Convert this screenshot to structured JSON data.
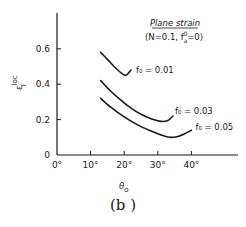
{
  "chart_data": {
    "type": "line",
    "title": "Plane strain",
    "subtitle": "(N=0.1, f_a^0=0)",
    "xlabel": "θ₀",
    "ylabel": "ε_I^loc",
    "xlim": [
      0,
      55
    ],
    "ylim": [
      0,
      0.78
    ],
    "x_ticks": [
      "0°",
      "10°",
      "20°",
      "30°",
      "40°"
    ],
    "y_ticks": [
      "0",
      "0.2",
      "0.4",
      "0.6"
    ],
    "grid": false,
    "legend": "inline labels at curve ends",
    "series": [
      {
        "name": "f₀=0.01",
        "label": "f₀ = 0.01",
        "x": [
          13,
          15,
          17,
          19,
          20.5,
          22
        ],
        "y": [
          0.58,
          0.54,
          0.5,
          0.465,
          0.45,
          0.48
        ]
      },
      {
        "name": "f₀=0.03",
        "label": "f₀ = 0.03",
        "x": [
          13,
          16,
          19,
          22,
          25,
          28,
          31,
          33,
          34.5
        ],
        "y": [
          0.42,
          0.36,
          0.31,
          0.265,
          0.23,
          0.205,
          0.19,
          0.195,
          0.22
        ]
      },
      {
        "name": "f₀=0.05",
        "label": "f₀ = 0.05",
        "x": [
          13,
          16,
          20,
          24,
          28,
          31,
          33.5,
          36,
          38,
          40
        ],
        "y": [
          0.32,
          0.27,
          0.215,
          0.17,
          0.135,
          0.113,
          0.1,
          0.105,
          0.12,
          0.14
        ]
      }
    ]
  },
  "text": {
    "title": "Plane strain",
    "subtitle_prefix": "(N=0.1, f",
    "subtitle_suffix": "=0)",
    "ylabel_main": "ε",
    "ylabel_sup": "loc",
    "ylabel_sub": "I",
    "xlabel_main": "θ",
    "xlabel_sub": "o",
    "caption": "(b )"
  }
}
